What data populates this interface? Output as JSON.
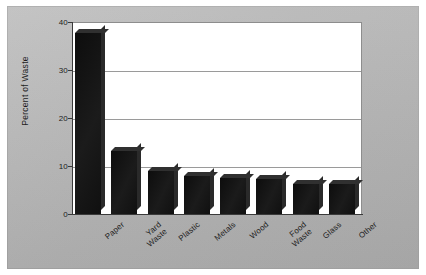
{
  "chart_data": {
    "type": "bar",
    "title": "",
    "xlabel": "",
    "ylabel": "Percent of Waste",
    "categories": [
      "Paper",
      "Yard Waste",
      "Plastic",
      "Metals",
      "Wood",
      "Food Waste",
      "Glass",
      "Other"
    ],
    "values": [
      37.8,
      13.2,
      8.9,
      8.0,
      7.5,
      7.2,
      6.2,
      6.2
    ],
    "ylim": [
      0,
      40
    ],
    "yticks": [
      0,
      10,
      20,
      30,
      40
    ],
    "ytick_labels": [
      "0",
      "10",
      "20",
      "30",
      "40"
    ],
    "grid": true,
    "grid_axis": "y",
    "legend": false,
    "bar_color": "#141414",
    "plot_background": "#ffffff",
    "figure_background": "#b7b7b7",
    "axis_color": "#3a3a3a",
    "gridline_color": "#9a9a9a"
  },
  "axis": {
    "y_title": "Percent of Waste",
    "ticks": [
      {
        "label": "40",
        "value": 40
      },
      {
        "label": "30",
        "value": 30
      },
      {
        "label": "20",
        "value": 20
      },
      {
        "label": "10",
        "value": 10
      },
      {
        "label": "0",
        "value": 0
      }
    ]
  },
  "bars": [
    {
      "label": "Paper",
      "value": 37.8
    },
    {
      "label": "Yard\nWaste",
      "value": 13.2
    },
    {
      "label": "Plastic",
      "value": 8.9
    },
    {
      "label": "Metals",
      "value": 8.0
    },
    {
      "label": "Wood",
      "value": 7.5
    },
    {
      "label": "Food\nWaste",
      "value": 7.2
    },
    {
      "label": "Glass",
      "value": 6.2
    },
    {
      "label": "Other",
      "value": 6.2
    }
  ]
}
